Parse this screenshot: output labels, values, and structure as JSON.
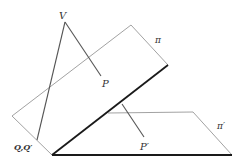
{
  "diagram": {
    "labels": {
      "V": "V",
      "P": "P",
      "P_prime": "P′",
      "QQ_prime": "Q,Q′",
      "pi": "π",
      "pi_prime": "π′"
    },
    "colors": {
      "thin_line": "#8a8a8a",
      "mid_line": "#555555",
      "bold_line": "#1a1a1a",
      "label": "#333333"
    }
  }
}
